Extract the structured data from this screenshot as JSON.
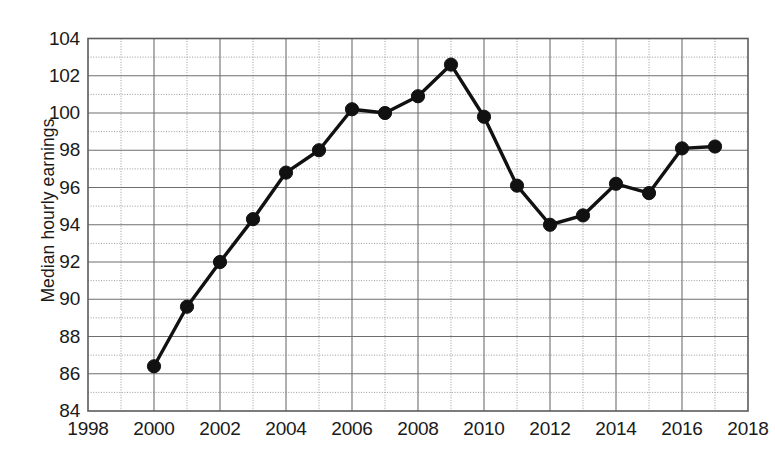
{
  "chart_data": {
    "type": "line",
    "title": "",
    "xlabel": "",
    "ylabel": "Median hourly earnings",
    "xlim": [
      1998,
      2018
    ],
    "ylim": [
      84,
      104
    ],
    "grid": true,
    "legend": "none",
    "x_tick_labels": [
      "1998",
      "2000",
      "2002",
      "2004",
      "2006",
      "2008",
      "2010",
      "2012",
      "2014",
      "2016",
      "2018"
    ],
    "x_ticks": [
      1998,
      2000,
      2002,
      2004,
      2006,
      2008,
      2010,
      2012,
      2014,
      2016,
      2018
    ],
    "y_tick_labels": [
      "84",
      "86",
      "88",
      "90",
      "92",
      "94",
      "96",
      "98",
      "100",
      "102",
      "104"
    ],
    "y_ticks": [
      84,
      86,
      88,
      90,
      92,
      94,
      96,
      98,
      100,
      102,
      104
    ],
    "minor_y_gridlines": [
      85,
      87,
      89,
      91,
      93,
      95,
      97,
      99,
      101,
      103
    ],
    "minor_x_gridlines": [
      1999,
      2001,
      2003,
      2005,
      2007,
      2009,
      2011,
      2013,
      2015,
      2017
    ],
    "series": [
      {
        "name": "Median hourly earnings",
        "color": "#111111",
        "marker": "filled-circle",
        "x": [
          2000,
          2001,
          2002,
          2003,
          2004,
          2005,
          2006,
          2007,
          2008,
          2009,
          2010,
          2011,
          2012,
          2013,
          2014,
          2015,
          2016,
          2017
        ],
        "values": [
          86.4,
          89.6,
          92.0,
          94.3,
          96.8,
          98.0,
          100.2,
          100.0,
          100.9,
          102.6,
          99.8,
          96.1,
          94.0,
          94.5,
          96.2,
          95.7,
          98.1,
          98.2
        ]
      }
    ]
  },
  "axes": {
    "y_axis_title": "Median hourly earnings"
  }
}
